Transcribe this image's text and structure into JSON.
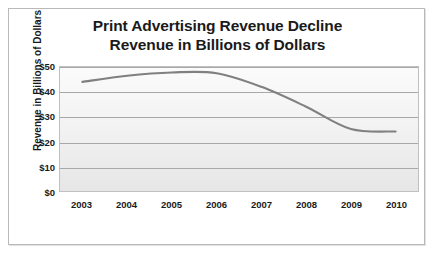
{
  "chart_data": {
    "type": "line",
    "title": "Print Advertising Revenue Decline",
    "subtitle": "Revenue in Billions of Dollars",
    "xlabel": "",
    "ylabel": "Revenue in Billions of Dollars",
    "categories": [
      "2003",
      "2004",
      "2005",
      "2006",
      "2007",
      "2008",
      "2009",
      "2010"
    ],
    "x": [
      2003,
      2004,
      2005,
      2006,
      2007,
      2008,
      2009,
      2010
    ],
    "values": [
      44,
      46.5,
      47.8,
      47.5,
      42,
      34,
      25,
      24
    ],
    "series": [
      {
        "name": "Print Advertising Revenue",
        "values": [
          44,
          46.5,
          47.8,
          47.5,
          42,
          34,
          25,
          24
        ]
      }
    ],
    "ylim": [
      0,
      50
    ],
    "ytick_labels": [
      "$50",
      "$40",
      "$30",
      "$20",
      "$10",
      "$0"
    ],
    "ytick_values": [
      50,
      40,
      30,
      20,
      10,
      0
    ],
    "grid": true,
    "legend": false,
    "legend_position": "none",
    "line_color": "#808080",
    "plot_background": "#f2f2f2",
    "frame_color": "#b9b9b9",
    "gridline_color": "#a8a8a8",
    "smoothed": true
  }
}
